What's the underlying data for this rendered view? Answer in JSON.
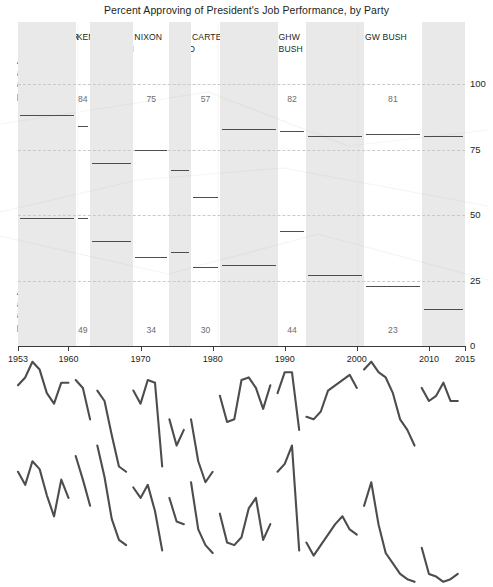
{
  "title": "Percent Approving of President's Job Performance, by Party",
  "captions": {
    "own": [
      "Average",
      "approval",
      "among own_",
      "party:"
    ],
    "other": [
      "Average",
      "approval",
      "among other",
      "party:"
    ]
  },
  "series_labels": {
    "republicans": "Republicans",
    "democrats": "Democrats"
  },
  "colors": {
    "line": "#4d4d4d",
    "band": "#e9e9e9",
    "axis": "#3b3b3b",
    "grid": "#c9c9c9",
    "value_text": "#6d6d6d",
    "label_text": "#231f20",
    "series_label": "#8a8a8a"
  },
  "presidents": [
    {
      "name": "EISENHOWER",
      "row": 1,
      "start": 1953,
      "end": 1961,
      "own_party": 88,
      "other_party": 49
    },
    {
      "name": "KENNEDY",
      "row": 1,
      "start": 1961,
      "end": 1963,
      "own_party": 84,
      "other_party": 49
    },
    {
      "name": "JOHNSON",
      "row": 2,
      "start": 1963,
      "end": 1969,
      "own_party": 70,
      "other_party": 40
    },
    {
      "name": "NIXON",
      "row": 1,
      "start": 1969,
      "end": 1974,
      "own_party": 75,
      "other_party": 34
    },
    {
      "name": "FORD",
      "row": 2,
      "start": 1974,
      "end": 1977,
      "own_party": 67,
      "other_party": 36
    },
    {
      "name": "CARTER",
      "row": 1,
      "start": 1977,
      "end": 1981,
      "own_party": 57,
      "other_party": 30
    },
    {
      "name": "REAGAN",
      "row": 1,
      "start": 1981,
      "end": 1989,
      "own_party": 83,
      "other_party": 31
    },
    {
      "name": "GHW",
      "row": 1,
      "start": 1989,
      "end": 1993,
      "own_party": 82,
      "other_party": 44
    },
    {
      "name": "BUSH",
      "row": 2,
      "start": 1989,
      "end": 1993,
      "own_party": null,
      "other_party": null
    },
    {
      "name": "CLINTON",
      "row": 1,
      "start": 1993,
      "end": 2001,
      "own_party": 80,
      "other_party": 27
    },
    {
      "name": "GW BUSH",
      "row": 1,
      "start": 2001,
      "end": 2009,
      "own_party": 81,
      "other_party": 23
    },
    {
      "name": "OBAMA",
      "row": 1,
      "start": 2009,
      "end": 2015,
      "own_party": 80,
      "other_party": 14
    }
  ],
  "chart_data": {
    "type": "line",
    "title": "Percent Approving of President's Job Performance, by Party",
    "xlabel": "",
    "ylabel": "",
    "xlim": [
      1953,
      2015
    ],
    "ylim": [
      0,
      100
    ],
    "yticks": [
      0,
      25,
      50,
      75,
      100
    ],
    "xticks": [
      1953,
      1960,
      1970,
      1980,
      1990,
      2000,
      2010,
      2015
    ],
    "grid": true,
    "legend": "inline-annotations",
    "annotations": [
      "Average approval among own party",
      "Average approval among other party",
      "Republicans",
      "Democrats"
    ],
    "note": "Each presidential term is a separate line segment; gray vertical bands mark alternating terms. Upper line in each term = president's own party; lower line = opposing party.",
    "series": [
      {
        "name": "EISENHOWER own party (Republicans)",
        "term": "1953-1961",
        "x": [
          1953,
          1954,
          1955,
          1956,
          1957,
          1958,
          1959,
          1960
        ],
        "values": [
          85,
          88,
          94,
          91,
          82,
          78,
          86,
          86
        ]
      },
      {
        "name": "EISENHOWER other party (Democrats)",
        "term": "1953-1961",
        "x": [
          1953,
          1954,
          1955,
          1956,
          1957,
          1958,
          1959,
          1960
        ],
        "values": [
          52,
          47,
          56,
          53,
          43,
          35,
          49,
          42
        ]
      },
      {
        "name": "KENNEDY own party (Democrats)",
        "term": "1961-1963",
        "x": [
          1961,
          1962,
          1963
        ],
        "values": [
          87,
          84,
          72
        ]
      },
      {
        "name": "KENNEDY other party (Republicans)",
        "term": "1961-1963",
        "x": [
          1961,
          1962,
          1963
        ],
        "values": [
          58,
          49,
          39
        ]
      },
      {
        "name": "JOHNSON own party (Democrats)",
        "term": "1963-1969",
        "x": [
          1964,
          1965,
          1966,
          1967,
          1968
        ],
        "values": [
          83,
          79,
          66,
          54,
          52
        ]
      },
      {
        "name": "JOHNSON other party (Republicans)",
        "term": "1963-1969",
        "x": [
          1964,
          1965,
          1966,
          1967,
          1968
        ],
        "values": [
          62,
          50,
          34,
          26,
          24
        ]
      },
      {
        "name": "NIXON own party (Republicans)",
        "term": "1969-1974",
        "x": [
          1969,
          1970,
          1971,
          1972,
          1973
        ],
        "values": [
          83,
          78,
          87,
          86,
          54
        ]
      },
      {
        "name": "NIXON other party (Democrats)",
        "term": "1969-1974",
        "x": [
          1969,
          1970,
          1971,
          1972,
          1973
        ],
        "values": [
          46,
          42,
          47,
          37,
          22
        ]
      },
      {
        "name": "FORD own party (Republicans)",
        "term": "1974-1977",
        "x": [
          1974,
          1975,
          1976
        ],
        "values": [
          72,
          62,
          68
        ]
      },
      {
        "name": "FORD other party (Democrats)",
        "term": "1974-1977",
        "x": [
          1974,
          1975,
          1976
        ],
        "values": [
          42,
          33,
          32
        ]
      },
      {
        "name": "CARTER own party (Democrats)",
        "term": "1977-1981",
        "x": [
          1977,
          1978,
          1979,
          1980
        ],
        "values": [
          72,
          56,
          48,
          52
        ]
      },
      {
        "name": "CARTER other party (Republicans)",
        "term": "1977-1981",
        "x": [
          1977,
          1978,
          1979,
          1980
        ],
        "values": [
          48,
          30,
          24,
          21
        ]
      },
      {
        "name": "REAGAN own party (Republicans)",
        "term": "1981-1989",
        "x": [
          1981,
          1982,
          1983,
          1984,
          1985,
          1986,
          1987,
          1988
        ],
        "values": [
          81,
          71,
          72,
          87,
          88,
          84,
          76,
          85
        ]
      },
      {
        "name": "REAGAN other party (Democrats)",
        "term": "1981-1989",
        "x": [
          1981,
          1982,
          1983,
          1984,
          1985,
          1986,
          1987,
          1988
        ],
        "values": [
          36,
          25,
          24,
          27,
          38,
          42,
          26,
          32
        ]
      },
      {
        "name": "GHW BUSH own party (Republicans)",
        "term": "1989-1993",
        "x": [
          1989,
          1990,
          1991,
          1992
        ],
        "values": [
          82,
          90,
          90,
          68
        ]
      },
      {
        "name": "GHW BUSH other party (Democrats)",
        "term": "1989-1993",
        "x": [
          1989,
          1990,
          1991,
          1992
        ],
        "values": [
          52,
          55,
          62,
          22
        ]
      },
      {
        "name": "CLINTON own party (Democrats)",
        "term": "1993-2001",
        "x": [
          1993,
          1994,
          1995,
          1996,
          1997,
          1998,
          1999,
          2000
        ],
        "values": [
          73,
          72,
          75,
          83,
          85,
          87,
          89,
          84
        ]
      },
      {
        "name": "CLINTON other party (Republicans)",
        "term": "1993-2001",
        "x": [
          1993,
          1994,
          1995,
          1996,
          1997,
          1998,
          1999,
          2000
        ],
        "values": [
          25,
          20,
          24,
          28,
          32,
          35,
          30,
          28
        ]
      },
      {
        "name": "GW BUSH own party (Republicans)",
        "term": "2001-2009",
        "x": [
          2001,
          2002,
          2003,
          2004,
          2005,
          2006,
          2007,
          2008
        ],
        "values": [
          91,
          94,
          90,
          88,
          82,
          72,
          68,
          62
        ]
      },
      {
        "name": "GW BUSH other party (Democrats)",
        "term": "2001-2009",
        "x": [
          2001,
          2002,
          2003,
          2004,
          2005,
          2006,
          2007,
          2008
        ],
        "values": [
          39,
          48,
          32,
          21,
          17,
          13,
          11,
          10
        ]
      },
      {
        "name": "OBAMA own party (Democrats)",
        "term": "2009-2015",
        "x": [
          2009,
          2010,
          2011,
          2012,
          2013,
          2014
        ],
        "values": [
          84,
          79,
          81,
          86,
          79,
          79
        ]
      },
      {
        "name": "OBAMA other party (Republicans)",
        "term": "2009-2015",
        "x": [
          2009,
          2010,
          2011,
          2012,
          2013,
          2014
        ],
        "values": [
          23,
          13,
          12,
          10,
          11,
          13
        ]
      }
    ]
  }
}
